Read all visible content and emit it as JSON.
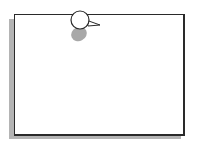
{
  "illustration": {
    "subject": "pinned note",
    "icons": [
      "pushpin-icon"
    ],
    "colors": {
      "paper": "#ffffff",
      "border": "#2a2a2a",
      "shadow": "#b4b4b4",
      "pin_head": "#ffffff",
      "pin_shadow": "#a8a8a8"
    }
  }
}
